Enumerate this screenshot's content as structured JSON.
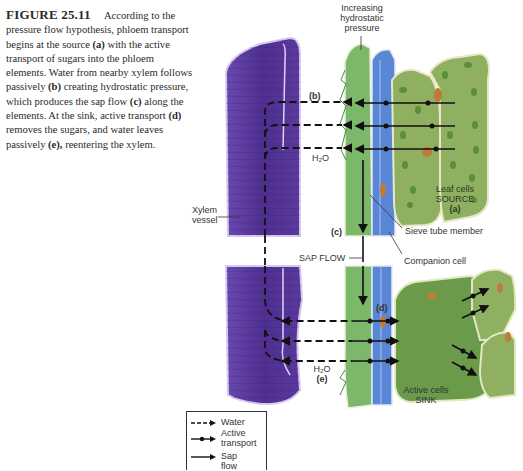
{
  "caption": {
    "figure_label": "FIGURE 25.11",
    "segments": [
      {
        "t": "According to the pressure flow hypothesis, phloem transport begins at the source ",
        "b": false
      },
      {
        "t": "(a)",
        "b": true
      },
      {
        "t": " with the active transport of sugars into the phloem elements. Water from nearby xylem follows passively ",
        "b": false
      },
      {
        "t": "(b)",
        "b": true
      },
      {
        "t": " creating hydrostatic pressure, which produces the sap flow ",
        "b": false
      },
      {
        "t": "(c)",
        "b": true
      },
      {
        "t": " along the elements. At the sink, active transport ",
        "b": false
      },
      {
        "t": "(d)",
        "b": true
      },
      {
        "t": " removes the sugars, and water leaves passively ",
        "b": false
      },
      {
        "t": "(e),",
        "b": true
      },
      {
        "t": " reentering the xylem.",
        "b": false
      }
    ]
  },
  "labels": {
    "increasing_line1": "Increasing",
    "increasing_line2": "hydrostatic",
    "increasing_line3": "pressure",
    "b": "(b)",
    "h2o_top": "H₂O",
    "leaf_cells": "Leaf cells",
    "source": "SOURCE",
    "a": "(a)",
    "xylem_line1": "Xylem",
    "xylem_line2": "vessel",
    "c": "(c)",
    "sieve_tube": "Sieve tube member",
    "sap_flow": "SAP FLOW",
    "companion_cell": "Companion cell",
    "d": "(d)",
    "h2o_bottom": "H₂O",
    "e": "(e)",
    "active_cells": "Active cells",
    "sink": "SINK"
  },
  "legend": {
    "items": [
      {
        "label": "Water",
        "style": "dashed-arrow"
      },
      {
        "label": "Active transport",
        "label_line1": "Active",
        "label_line2": "transport",
        "style": "dot-arrow"
      },
      {
        "label": "Sap flow",
        "style": "solid-arrow"
      }
    ]
  },
  "colors": {
    "xylem": "#5a3a9a",
    "xylem_light": "#7a5ab8",
    "phloem_green": "#7bb86a",
    "companion_blue": "#5a86d6",
    "leaf_green": "#8fb060",
    "cell_dark_green": "#6a9a4a",
    "nucleus": "#c07a3a",
    "arrow": "#111111"
  }
}
